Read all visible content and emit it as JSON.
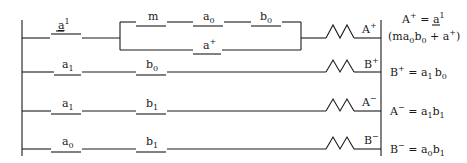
{
  "diagram": {
    "type": "ladder-logic",
    "rungs": [
      {
        "id": "rung-1",
        "contacts_series": [
          {
            "base": "a",
            "sup": "1",
            "underline": true
          }
        ],
        "parallel_branch": {
          "top": [
            {
              "base": "m",
              "sub": ""
            },
            {
              "base": "a",
              "sub": "0"
            },
            {
              "base": "b",
              "sub": "0"
            }
          ],
          "bottom": [
            {
              "base": "a",
              "sup": "+"
            }
          ]
        },
        "coil": {
          "base": "A",
          "sup": "+"
        },
        "equation": {
          "line1_lhs_base": "A",
          "line1_lhs_sup": "+",
          "line1_eq": " = ",
          "line1_rhs_base": "a",
          "line1_rhs_sup": "1",
          "line2": "(ma",
          "line2_sub0": "0",
          "line2_b": "b",
          "line2_sub1": "0",
          "line2_plus": " + a",
          "line2_sup": "+",
          "line2_close": ")"
        }
      },
      {
        "id": "rung-2",
        "contacts": [
          {
            "base": "a",
            "sub": "1"
          },
          {
            "base": "b",
            "sub": "0"
          }
        ],
        "coil": {
          "base": "B",
          "sup": "+"
        },
        "equation": {
          "lhs": "B",
          "lhs_sup": "+",
          "eq": " = ",
          "t1": "a",
          "t1_sub": "1",
          "t2": "b",
          "t2_sub": "0"
        }
      },
      {
        "id": "rung-3",
        "contacts": [
          {
            "base": "a",
            "sub": "1"
          },
          {
            "base": "b",
            "sub": "1"
          }
        ],
        "coil": {
          "base": "A",
          "sup": "−"
        },
        "equation": {
          "lhs": "A",
          "lhs_sup": "−",
          "eq": " = ",
          "t1": "a",
          "t1_sub": "1",
          "t2": "b",
          "t2_sub": "1"
        }
      },
      {
        "id": "rung-4",
        "contacts": [
          {
            "base": "a",
            "sub": "0"
          },
          {
            "base": "b",
            "sub": "1"
          }
        ],
        "coil": {
          "base": "B",
          "sup": "−"
        },
        "equation": {
          "lhs": "B",
          "lhs_sup": "−",
          "eq": " = ",
          "t1": "a",
          "t1_sub": "0",
          "t2": "b",
          "t2_sub": "1"
        }
      }
    ]
  }
}
